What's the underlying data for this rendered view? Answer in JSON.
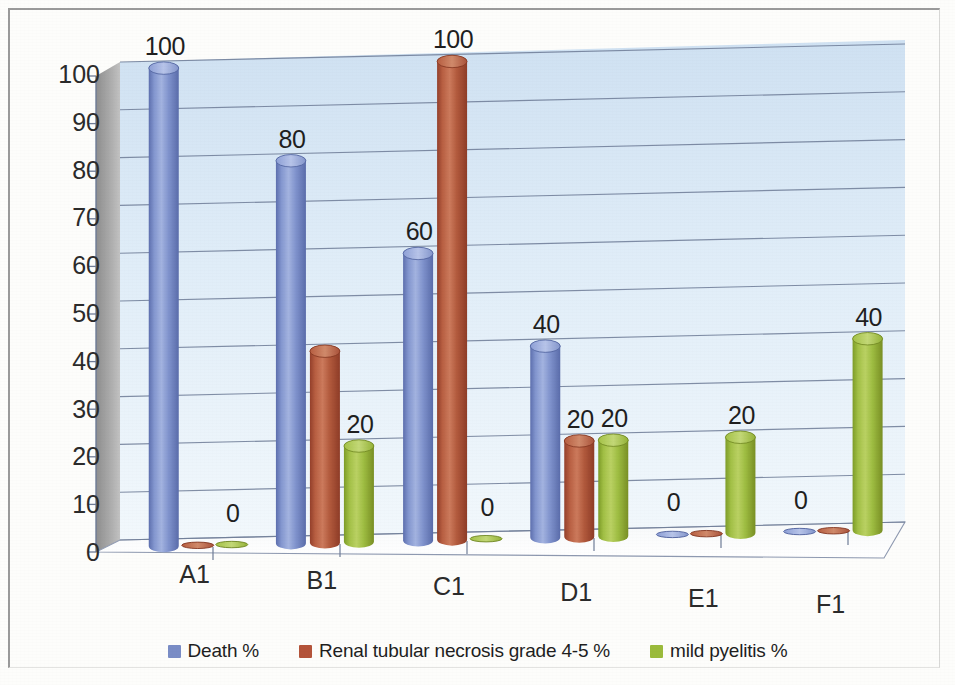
{
  "chart_data": {
    "type": "bar",
    "title": "",
    "subtitle": "",
    "xlabel": "",
    "ylabel": "",
    "categories": [
      "A1",
      "B1",
      "C1",
      "D1",
      "E1",
      "F1"
    ],
    "ylim": [
      0,
      100
    ],
    "yticks": [
      "0",
      "10",
      "20",
      "30",
      "40",
      "50",
      "60",
      "70",
      "80",
      "90",
      "100"
    ],
    "grid": true,
    "legend_position": "bottom",
    "style": "3d-cylinder",
    "series": [
      {
        "name": "Death %",
        "color": "#7A8DC6",
        "values": [
          100,
          80,
          60,
          40,
          0,
          0
        ],
        "labels": [
          "100",
          "80",
          "60",
          "40",
          "0",
          "0"
        ],
        "labels_visible": [
          true,
          true,
          true,
          true,
          true,
          true
        ]
      },
      {
        "name": "Renal tubular necrosis grade 4-5 %",
        "color": "#B4543A",
        "values": [
          0,
          40,
          100,
          20,
          0,
          0
        ],
        "labels": [
          "0",
          "40",
          "100",
          "20",
          "0",
          "0"
        ],
        "labels_visible": [
          false,
          false,
          true,
          true,
          false,
          false
        ]
      },
      {
        "name": "mild pyelitis %",
        "color": "#9BBB3C",
        "values": [
          0,
          20,
          0,
          20,
          20,
          40
        ],
        "labels": [
          "0",
          "20",
          "0",
          "20",
          "20",
          "40"
        ],
        "labels_visible": [
          true,
          true,
          true,
          true,
          true,
          true
        ]
      }
    ],
    "annotations": [
      {
        "text": "100",
        "category": "A1",
        "series": "Death %"
      },
      {
        "text": "0",
        "category": "A1",
        "series": "mild pyelitis %"
      },
      {
        "text": "80",
        "category": "B1",
        "series": "Death %"
      },
      {
        "text": "20",
        "category": "B1",
        "series": "mild pyelitis %"
      },
      {
        "text": "60",
        "category": "C1",
        "series": "Death %"
      },
      {
        "text": "100",
        "category": "C1",
        "series": "Renal tubular necrosis grade 4-5 %"
      },
      {
        "text": "0",
        "category": "C1",
        "series": "mild pyelitis %"
      },
      {
        "text": "40",
        "category": "D1",
        "series": "Death %"
      },
      {
        "text": "20",
        "category": "D1",
        "series": "Renal tubular necrosis grade 4-5 %"
      },
      {
        "text": "20",
        "category": "D1",
        "series": "mild pyelitis %"
      },
      {
        "text": "0",
        "category": "E1",
        "series": "Death %"
      },
      {
        "text": "20",
        "category": "E1",
        "series": "mild pyelitis %"
      },
      {
        "text": "0",
        "category": "F1",
        "series": "Death %"
      },
      {
        "text": "40",
        "category": "F1",
        "series": "mild pyelitis %"
      }
    ]
  },
  "legend": {
    "items": [
      {
        "label": "Death %",
        "color": "#7A8DC6"
      },
      {
        "label": "Renal tubular necrosis grade 4-5 %",
        "color": "#B4543A"
      },
      {
        "label": "mild pyelitis %",
        "color": "#9BBB3C"
      }
    ]
  },
  "colors": {
    "plot_wall": "#DCE9F5",
    "side_wall": "#9A9A9A",
    "floor": "#FBFBFA",
    "gridline": "#6E7C97",
    "page_background": "#FDFDFB",
    "text": "#2B2B2B"
  }
}
